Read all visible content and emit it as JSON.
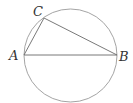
{
  "diagram": {
    "colors": {
      "circle": "#9a9a9a",
      "lines": "#6a6a6a",
      "label": "#333333"
    },
    "circle": {
      "cx": 70.5,
      "cy": 55.5,
      "r": 46.5
    },
    "points": {
      "A": {
        "x": 24,
        "y": 55,
        "label": "A",
        "lx": 9,
        "ly": 60
      },
      "B": {
        "x": 117,
        "y": 55,
        "label": "B",
        "lx": 119,
        "ly": 61
      },
      "C": {
        "x": 44,
        "y": 18,
        "label": "C",
        "lx": 33,
        "ly": 16
      }
    },
    "segments": [
      {
        "from": "A",
        "to": "B",
        "name": "diameter-ab"
      },
      {
        "from": "A",
        "to": "C",
        "name": "segment-ac"
      },
      {
        "from": "C",
        "to": "B",
        "name": "segment-cb"
      }
    ]
  }
}
